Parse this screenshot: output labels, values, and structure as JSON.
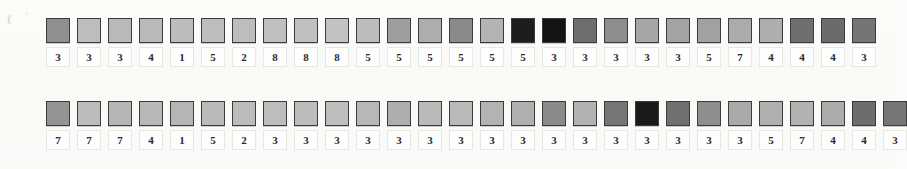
{
  "page": {
    "background_color": "#fbfbf9",
    "swatch_border_color": "#3b3b3b",
    "label_text_color": "#2b2b2b",
    "label_box_color": "#fefefe",
    "smudge_mark": "ℓ"
  },
  "rows": [
    {
      "name": "row-1",
      "cells": [
        {
          "value": "3",
          "color": "#8f8f8f"
        },
        {
          "value": "3",
          "color": "#bdbdbd"
        },
        {
          "value": "3",
          "color": "#b9b9b9"
        },
        {
          "value": "4",
          "color": "#bababa"
        },
        {
          "value": "1",
          "color": "#bcbcbc"
        },
        {
          "value": "5",
          "color": "#bebebe"
        },
        {
          "value": "2",
          "color": "#bdbdbd"
        },
        {
          "value": "8",
          "color": "#bfbfbf"
        },
        {
          "value": "8",
          "color": "#c0c0c0"
        },
        {
          "value": "8",
          "color": "#c2c2c2"
        },
        {
          "value": "5",
          "color": "#bcbcbc"
        },
        {
          "value": "5",
          "color": "#9e9e9e"
        },
        {
          "value": "5",
          "color": "#adadad"
        },
        {
          "value": "5",
          "color": "#8a8a8a"
        },
        {
          "value": "5",
          "color": "#b4b4b4"
        },
        {
          "value": "5",
          "color": "#1d1d1d"
        },
        {
          "value": "3",
          "color": "#141414"
        },
        {
          "value": "3",
          "color": "#6e6e6e"
        },
        {
          "value": "3",
          "color": "#8d8d8d"
        },
        {
          "value": "3",
          "color": "#a6a6a6"
        },
        {
          "value": "3",
          "color": "#a3a3a3"
        },
        {
          "value": "5",
          "color": "#a1a1a1"
        },
        {
          "value": "7",
          "color": "#ababab"
        },
        {
          "value": "4",
          "color": "#aeaeae"
        },
        {
          "value": "4",
          "color": "#6f6f6f"
        },
        {
          "value": "4",
          "color": "#6b6b6b"
        },
        {
          "value": "3",
          "color": "#757575"
        }
      ]
    },
    {
      "name": "row-2",
      "cells": [
        {
          "value": "7",
          "color": "#949494"
        },
        {
          "value": "7",
          "color": "#bcbcbc"
        },
        {
          "value": "7",
          "color": "#b6b6b6"
        },
        {
          "value": "4",
          "color": "#b8b8b8"
        },
        {
          "value": "1",
          "color": "#b5b5b5"
        },
        {
          "value": "5",
          "color": "#bababa"
        },
        {
          "value": "2",
          "color": "#bbbbbb"
        },
        {
          "value": "3",
          "color": "#bdbdbd"
        },
        {
          "value": "3",
          "color": "#bcbcbc"
        },
        {
          "value": "3",
          "color": "#bebebe"
        },
        {
          "value": "3",
          "color": "#b7b7b7"
        },
        {
          "value": "3",
          "color": "#aeaeae"
        },
        {
          "value": "3",
          "color": "#bababa"
        },
        {
          "value": "3",
          "color": "#b9b9b9"
        },
        {
          "value": "3",
          "color": "#b3b3b3"
        },
        {
          "value": "3",
          "color": "#b0b0b0"
        },
        {
          "value": "3",
          "color": "#8a8a8a"
        },
        {
          "value": "3",
          "color": "#b2b2b2"
        },
        {
          "value": "3",
          "color": "#767676"
        },
        {
          "value": "3",
          "color": "#1a1a1a"
        },
        {
          "value": "3",
          "color": "#707070"
        },
        {
          "value": "3",
          "color": "#8e8e8e"
        },
        {
          "value": "3",
          "color": "#a9a9a9"
        },
        {
          "value": "5",
          "color": "#b0b0b0"
        },
        {
          "value": "7",
          "color": "#b2b2b2"
        },
        {
          "value": "4",
          "color": "#acacac"
        },
        {
          "value": "4",
          "color": "#6d6d6d"
        },
        {
          "value": "3",
          "color": "#767676"
        }
      ]
    }
  ]
}
